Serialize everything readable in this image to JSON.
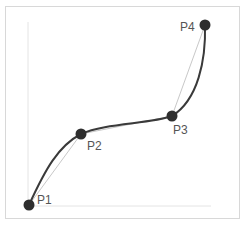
{
  "diagram": {
    "title": "",
    "type": "spline-through-control-points",
    "colors": {
      "curve": "#3a3a3a",
      "polyline": "#c8c8c8",
      "point": "#2e2e2e",
      "axis": "#e4e4e4",
      "frame": "#d8d8d8",
      "label": "#555555"
    },
    "points": [
      {
        "label": "P1",
        "x": 29,
        "y": 205
      },
      {
        "label": "P2",
        "x": 81,
        "y": 134
      },
      {
        "label": "P3",
        "x": 172,
        "y": 116
      },
      {
        "label": "P4",
        "x": 205,
        "y": 25
      }
    ]
  }
}
